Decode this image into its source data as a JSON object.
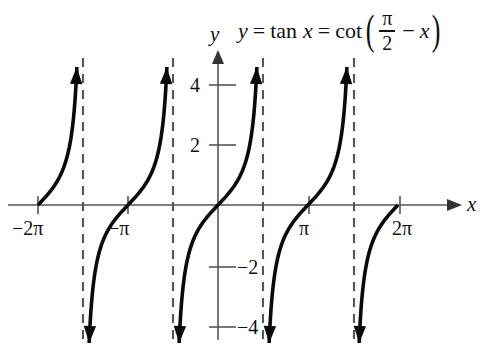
{
  "figure": {
    "title_equation": {
      "lhs": "y",
      "equals_1": "=",
      "fn_tan": "tan",
      "arg_tan": "x",
      "equals_2": "=",
      "fn_cot": "cot",
      "paren_open": "(",
      "frac_num": "π",
      "frac_den": "2",
      "minus": "−",
      "arg_x": "x",
      "paren_close": ")",
      "plain": "y = tan x = cot(π/2 − x)"
    },
    "axes": {
      "x_label": "x",
      "y_label": "y",
      "x_ticks": [
        {
          "label": "−2π",
          "value": -6.2832
        },
        {
          "label": "−π",
          "value": -3.1416
        },
        {
          "label": "π",
          "value": 3.1416
        },
        {
          "label": "2π",
          "value": 6.2832
        }
      ],
      "y_ticks": [
        {
          "label": "4",
          "value": 4
        },
        {
          "label": "2",
          "value": 2
        },
        {
          "label": "−2",
          "value": -2
        },
        {
          "label": "−4",
          "value": -4
        }
      ]
    },
    "colors": {
      "curve": "#0a0a0a",
      "axis": "#555555",
      "asymptote": "#555555",
      "background": "#ffffff",
      "text": "#111111"
    }
  },
  "chart_data": {
    "type": "line",
    "xlabel": "x",
    "ylabel": "y",
    "function": "tan(x)",
    "xlim": [
      -7.5,
      8.6
    ],
    "ylim": [
      -4.8,
      5.0
    ],
    "grid": false,
    "legend": false,
    "x_tick_values": [
      -6.2832,
      -3.1416,
      3.1416,
      6.2832
    ],
    "x_tick_labels": [
      "−2π",
      "−π",
      "π",
      "2π"
    ],
    "y_tick_values": [
      4,
      2,
      -2,
      -4
    ],
    "y_tick_labels": [
      "4",
      "2",
      "−2",
      "−4"
    ],
    "asymptotes": [
      -4.7124,
      -1.5708,
      1.5708,
      4.7124
    ],
    "period": 3.1416,
    "branch_centers": [
      -6.2832,
      -3.1416,
      0,
      3.1416,
      6.2832
    ],
    "y_clip": [
      -4.6,
      4.6
    ],
    "series": [
      {
        "name": "tan x",
        "x": [
          -6.2832,
          -6.0,
          -5.6,
          -5.2,
          -4.9,
          -4.8,
          -3.1416,
          -2.9,
          -2.5,
          -2.1,
          -1.8,
          -1.65,
          -1.47,
          -1.2,
          -0.8,
          -0.4,
          0,
          0.4,
          0.8,
          1.2,
          1.47,
          1.65,
          1.8,
          2.1,
          2.5,
          2.9,
          3.1416,
          3.4,
          3.8,
          4.2,
          4.5,
          4.66,
          4.8,
          5.1,
          5.5,
          5.9,
          6.2832
        ],
        "y": [
          0,
          0.29,
          0.74,
          1.5,
          3.4,
          4.6,
          0,
          0.24,
          0.75,
          1.71,
          3.1,
          4.4,
          -4.6,
          -2.57,
          -1.03,
          -0.42,
          0,
          0.42,
          1.03,
          2.57,
          4.6,
          -4.4,
          -3.1,
          -1.71,
          -0.75,
          -0.24,
          0,
          0.26,
          0.77,
          1.78,
          4.6,
          4.6,
          -4.6,
          -2.6,
          -0.71,
          -0.37,
          0
        ]
      }
    ]
  }
}
